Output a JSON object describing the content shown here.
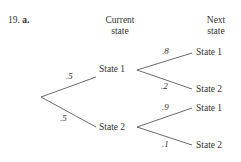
{
  "problem": {
    "number": "19.",
    "part": "a."
  },
  "headers": {
    "current": [
      "Current",
      "state"
    ],
    "next": [
      "Next",
      "state"
    ]
  },
  "root_branches": [
    {
      "prob": ".5",
      "state": "State 1"
    },
    {
      "prob": ".5",
      "state": "State 2"
    }
  ],
  "next_branches": {
    "from_state1": [
      {
        "prob": ".8",
        "state": "State 1"
      },
      {
        "prob": ".2",
        "state": "State 2"
      }
    ],
    "from_state2": [
      {
        "prob": ".9",
        "state": "State 1"
      },
      {
        "prob": ".1",
        "state": "State 2"
      }
    ]
  }
}
